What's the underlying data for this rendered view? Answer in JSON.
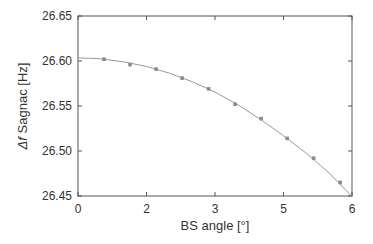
{
  "chart_data": {
    "type": "scatter",
    "title": "",
    "xlabel": "BS angle [°]",
    "ylabel_italic": "Δf",
    "ylabel_rest": " Sagnac [Hz]",
    "ylabel": "Δf Sagnac [Hz]",
    "xlim": [
      0,
      6
    ],
    "ylim": [
      26.45,
      26.65
    ],
    "x_ticks": [
      0,
      1.5,
      3,
      4.5,
      6
    ],
    "x_tick_labels": [
      "0",
      "2",
      "3",
      "5",
      "6"
    ],
    "y_ticks": [
      26.45,
      26.5,
      26.55,
      26.6,
      26.65
    ],
    "y_tick_labels": [
      "26.45",
      "26.50",
      "26.55",
      "26.60",
      "26.65"
    ],
    "grid": false,
    "legend": null,
    "series": [
      {
        "name": "measured",
        "style": "markers",
        "x": [
          0.57,
          1.14,
          1.71,
          2.28,
          2.86,
          3.44,
          4.01,
          4.58,
          5.16,
          5.74
        ],
        "y": [
          26.602,
          26.596,
          26.591,
          26.581,
          26.569,
          26.552,
          26.536,
          26.514,
          26.492,
          26.465
        ]
      },
      {
        "name": "fit",
        "style": "line",
        "x": [
          0,
          0.5,
          1.0,
          1.5,
          2.0,
          2.5,
          3.0,
          3.5,
          4.0,
          4.5,
          5.0,
          5.5,
          6.0
        ],
        "y": [
          26.6035,
          26.6025,
          26.599,
          26.594,
          26.5865,
          26.577,
          26.5655,
          26.5515,
          26.535,
          26.517,
          26.4975,
          26.4755,
          26.4495
        ]
      }
    ],
    "colors": {
      "axis": "#555555",
      "line": "#9a9a9a",
      "marker": "#8a8a8a",
      "text": "#333333"
    }
  }
}
